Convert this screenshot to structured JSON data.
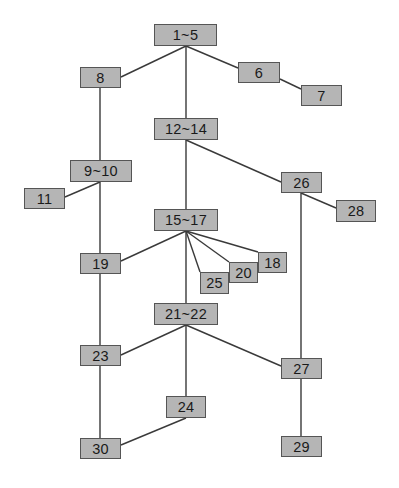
{
  "diagram": {
    "type": "tree",
    "colors": {
      "node_fill": "#b5b5b5",
      "node_border": "#555555",
      "edge": "#3a3a3a",
      "text": "#1a1a1a",
      "background": "#ffffff"
    },
    "nodes": [
      {
        "id": "n1_5",
        "label": "1~5",
        "x": 154,
        "y": 24,
        "w": 63,
        "h": 22
      },
      {
        "id": "n8",
        "label": "8",
        "x": 80,
        "y": 67,
        "w": 41,
        "h": 21
      },
      {
        "id": "n6",
        "label": "6",
        "x": 238,
        "y": 62,
        "w": 42,
        "h": 21
      },
      {
        "id": "n7",
        "label": "7",
        "x": 301,
        "y": 85,
        "w": 41,
        "h": 21
      },
      {
        "id": "n12_14",
        "label": "12~14",
        "x": 154,
        "y": 118,
        "w": 64,
        "h": 22
      },
      {
        "id": "n9_10",
        "label": "9~10",
        "x": 70,
        "y": 160,
        "w": 62,
        "h": 22
      },
      {
        "id": "n11",
        "label": "11",
        "x": 24,
        "y": 188,
        "w": 41,
        "h": 21
      },
      {
        "id": "n26",
        "label": "26",
        "x": 281,
        "y": 172,
        "w": 41,
        "h": 21
      },
      {
        "id": "n28",
        "label": "28",
        "x": 336,
        "y": 200,
        "w": 40,
        "h": 22
      },
      {
        "id": "n15_17",
        "label": "15~17",
        "x": 154,
        "y": 209,
        "w": 64,
        "h": 22
      },
      {
        "id": "n19",
        "label": "19",
        "x": 80,
        "y": 253,
        "w": 41,
        "h": 21
      },
      {
        "id": "n18",
        "label": "18",
        "x": 258,
        "y": 252,
        "w": 29,
        "h": 21
      },
      {
        "id": "n20",
        "label": "20",
        "x": 229,
        "y": 262,
        "w": 29,
        "h": 21
      },
      {
        "id": "n25",
        "label": "25",
        "x": 200,
        "y": 272,
        "w": 29,
        "h": 22
      },
      {
        "id": "n21_22",
        "label": "21~22",
        "x": 154,
        "y": 303,
        "w": 64,
        "h": 22
      },
      {
        "id": "n23",
        "label": "23",
        "x": 80,
        "y": 345,
        "w": 41,
        "h": 21
      },
      {
        "id": "n27",
        "label": "27",
        "x": 281,
        "y": 358,
        "w": 41,
        "h": 21
      },
      {
        "id": "n24",
        "label": "24",
        "x": 166,
        "y": 396,
        "w": 40,
        "h": 22
      },
      {
        "id": "n30",
        "label": "30",
        "x": 80,
        "y": 438,
        "w": 41,
        "h": 21
      },
      {
        "id": "n29",
        "label": "29",
        "x": 281,
        "y": 436,
        "w": 41,
        "h": 21
      }
    ],
    "edges": [
      {
        "from": "1~5",
        "to": "8",
        "x1": 186,
        "y1": 46,
        "x2": 121,
        "y2": 77
      },
      {
        "from": "1~5",
        "to": "6",
        "x1": 186,
        "y1": 46,
        "x2": 238,
        "y2": 68
      },
      {
        "from": "1~5",
        "to": "12~14",
        "x1": 186,
        "y1": 46,
        "x2": 186,
        "y2": 118
      },
      {
        "from": "6",
        "to": "7",
        "x1": 280,
        "y1": 79,
        "x2": 301,
        "y2": 89
      },
      {
        "from": "8",
        "to": "9~10",
        "x1": 100,
        "y1": 88,
        "x2": 100,
        "y2": 160
      },
      {
        "from": "9~10",
        "to": "11",
        "x1": 100,
        "y1": 182,
        "x2": 65,
        "y2": 197
      },
      {
        "from": "9~10",
        "to": "19",
        "x1": 100,
        "y1": 182,
        "x2": 100,
        "y2": 253
      },
      {
        "from": "12~14",
        "to": "15~17",
        "x1": 186,
        "y1": 140,
        "x2": 186,
        "y2": 209
      },
      {
        "from": "12~14",
        "to": "26",
        "x1": 186,
        "y1": 140,
        "x2": 281,
        "y2": 182
      },
      {
        "from": "26",
        "to": "28",
        "x1": 301,
        "y1": 193,
        "x2": 336,
        "y2": 208
      },
      {
        "from": "26",
        "to": "27",
        "x1": 301,
        "y1": 193,
        "x2": 301,
        "y2": 358
      },
      {
        "from": "15~17",
        "to": "19",
        "x1": 186,
        "y1": 231,
        "x2": 121,
        "y2": 261
      },
      {
        "from": "15~17",
        "to": "18",
        "x1": 186,
        "y1": 231,
        "x2": 258,
        "y2": 252
      },
      {
        "from": "15~17",
        "to": "20",
        "x1": 186,
        "y1": 231,
        "x2": 229,
        "y2": 262
      },
      {
        "from": "15~17",
        "to": "25",
        "x1": 186,
        "y1": 231,
        "x2": 200,
        "y2": 272
      },
      {
        "from": "15~17",
        "to": "21~22",
        "x1": 186,
        "y1": 231,
        "x2": 186,
        "y2": 303
      },
      {
        "from": "19",
        "to": "23",
        "x1": 100,
        "y1": 274,
        "x2": 100,
        "y2": 345
      },
      {
        "from": "21~22",
        "to": "23",
        "x1": 186,
        "y1": 325,
        "x2": 121,
        "y2": 355
      },
      {
        "from": "21~22",
        "to": "27",
        "x1": 186,
        "y1": 325,
        "x2": 281,
        "y2": 366
      },
      {
        "from": "21~22",
        "to": "24",
        "x1": 186,
        "y1": 325,
        "x2": 186,
        "y2": 396
      },
      {
        "from": "23",
        "to": "30",
        "x1": 100,
        "y1": 366,
        "x2": 100,
        "y2": 438
      },
      {
        "from": "24",
        "to": "30",
        "x1": 186,
        "y1": 418,
        "x2": 121,
        "y2": 445
      },
      {
        "from": "27",
        "to": "29",
        "x1": 301,
        "y1": 379,
        "x2": 301,
        "y2": 436
      }
    ]
  }
}
